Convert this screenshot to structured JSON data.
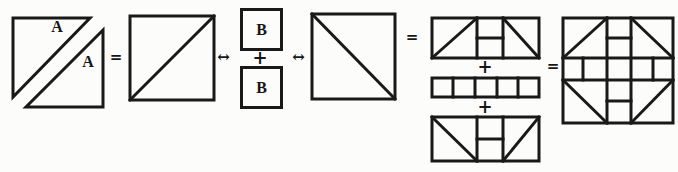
{
  "figure": {
    "colors": {
      "line": "#191919",
      "background": "#fcfcfa"
    },
    "labels": {
      "triangle_a_upper": "A",
      "triangle_a_lower": "A",
      "b_square_top": "B",
      "b_square_bottom": "B"
    },
    "operators": {
      "equals_1": "=",
      "arrow_1": "↔",
      "plus_b": "+",
      "arrow_2": "↔",
      "equals_2": "=",
      "plus_strip_1": "+",
      "plus_strip_2": "+",
      "equals_3": "="
    }
  }
}
